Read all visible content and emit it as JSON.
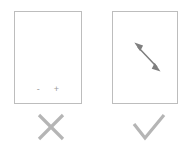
{
  "figure": {
    "type": "do-and-dont-instruction",
    "colors": {
      "background": "#ffffff",
      "panel_border": "#bdbdbd",
      "panel_fill": "#ffffff",
      "glyph_gray": "#9a9a9a",
      "arrow_gray": "#7f7f7f",
      "mark_gray": "#b5b5b5"
    }
  },
  "panels": [
    {
      "id": "dont",
      "verdict": "incorrect",
      "verdict_icon": "cross-icon",
      "controls": {
        "zoom_out_label": "-",
        "zoom_in_label": "+"
      }
    },
    {
      "id": "do",
      "verdict": "correct",
      "verdict_icon": "check-icon",
      "gesture": {
        "icon": "double-headed-diagonal-arrow-icon",
        "direction": "diagonal-bidirectional"
      }
    }
  ]
}
